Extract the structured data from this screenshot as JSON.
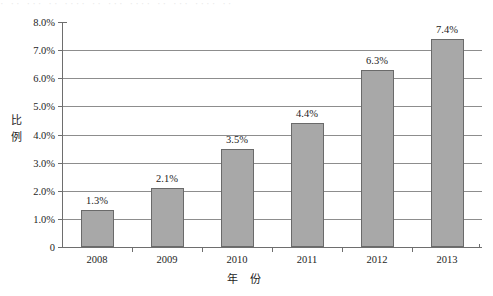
{
  "scan": {
    "top_bleed_text": "· ·· ··· ·· ···· ·· ··· ···· ·· ··· ···· ··"
  },
  "chart_data": {
    "type": "bar",
    "title": "",
    "xlabel": "年  份",
    "ylabel": "比例",
    "categories": [
      "2008",
      "2009",
      "2010",
      "2011",
      "2012",
      "2013"
    ],
    "values": [
      1.3,
      2.1,
      3.5,
      4.4,
      6.3,
      7.4
    ],
    "value_labels": [
      "1.3%",
      "2.1%",
      "3.5%",
      "4.4%",
      "6.3%",
      "7.4%"
    ],
    "ylim": [
      0,
      8.0
    ],
    "ytick_values": [
      8.0,
      7.0,
      6.0,
      5.0,
      4.0,
      3.0,
      2.0,
      1.0,
      0
    ],
    "ytick_labels": [
      "8.0%",
      "7.0%",
      "6.0%",
      "5.0%",
      "4.0%",
      "3.0%",
      "2.0%",
      "1.0%",
      "0"
    ],
    "gridline_values": [
      7.0,
      6.0,
      5.0,
      4.0,
      3.0,
      2.0,
      1.0
    ],
    "grid": true,
    "legend": null,
    "legend_position": "none",
    "series_color": "#a8a8a8",
    "series_border_color": "#6a6a6a",
    "axis_color": "#6e6e6e",
    "grid_color": "#8d8d8d"
  }
}
